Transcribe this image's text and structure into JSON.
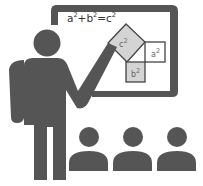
{
  "illustration": {
    "subject": "teacher presenting Pythagorean theorem to audience",
    "formula": {
      "a": "a",
      "b": "b",
      "c": "c",
      "exp": "2",
      "plus": "+",
      "eq": "="
    },
    "squares": {
      "c_label": "c",
      "a_label": "a",
      "b_label": "b",
      "exp": "2"
    },
    "audience_count": 3,
    "colors": {
      "figure": "#555555",
      "board_frame": "#555555",
      "square_fill": "#d4d4d4",
      "square_stroke": "#444444"
    }
  }
}
